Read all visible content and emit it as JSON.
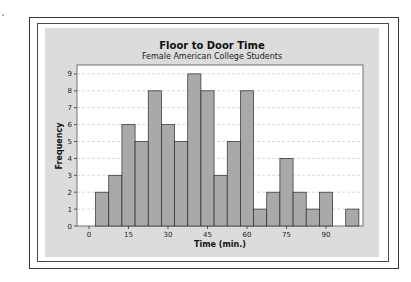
{
  "chart_data": {
    "type": "bar",
    "title": "Floor to Door Time",
    "subtitle": "Female American College Students",
    "xlabel": "Time (min.)",
    "ylabel": "Frequency",
    "x_ticks": [
      0,
      15,
      30,
      45,
      60,
      75,
      90
    ],
    "y_ticks": [
      0,
      1,
      2,
      3,
      4,
      5,
      6,
      7,
      8,
      9
    ],
    "ylim": [
      0,
      9.5
    ],
    "xlim": [
      -5,
      102
    ],
    "bin_width": 5,
    "bin_centers": [
      5,
      10,
      15,
      20,
      25,
      30,
      35,
      40,
      45,
      50,
      55,
      60,
      65,
      70,
      75,
      80,
      85,
      90,
      95,
      100
    ],
    "values": [
      2,
      3,
      6,
      5,
      8,
      6,
      5,
      9,
      8,
      3,
      5,
      8,
      1,
      2,
      4,
      2,
      1,
      2,
      0,
      1
    ],
    "grid": "horizontal dashed",
    "legend": "none",
    "colors": {
      "bar_fill": "#a9a9a9",
      "bar_edge": "#2a2a2a",
      "plot_bg": "#ffffff",
      "panel_bg": "#dcdcdc",
      "grid": "#c8c8c8"
    }
  }
}
